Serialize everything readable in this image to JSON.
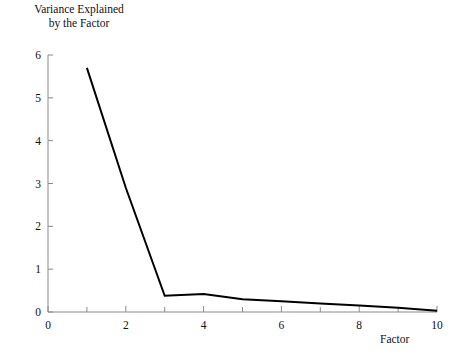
{
  "chart_data": {
    "type": "line",
    "title": "",
    "ylabel": "Variance Explained\nby the Factor",
    "xlabel": "Factor",
    "x": [
      1,
      2,
      3,
      4,
      5,
      6,
      7,
      8,
      9,
      10
    ],
    "values": [
      5.7,
      2.9,
      0.38,
      0.42,
      0.3,
      0.25,
      0.2,
      0.15,
      0.1,
      0.03
    ],
    "series": [
      {
        "name": "Variance Explained by the Factor",
        "values": [
          5.7,
          2.9,
          0.38,
          0.42,
          0.3,
          0.25,
          0.2,
          0.15,
          0.1,
          0.03
        ]
      }
    ],
    "xlim": [
      0,
      10
    ],
    "ylim": [
      0,
      6
    ],
    "x_ticks": [
      0,
      1,
      2,
      3,
      4,
      5,
      6,
      7,
      8,
      9,
      10
    ],
    "x_tick_labels": [
      "0",
      "",
      "2",
      "",
      "4",
      "",
      "6",
      "",
      "8",
      "",
      "10"
    ],
    "y_ticks": [
      0,
      1,
      2,
      3,
      4,
      5,
      6
    ],
    "y_tick_labels": [
      "0",
      "1",
      "2",
      "3",
      "4",
      "5",
      "6"
    ],
    "grid": false,
    "legend": "none",
    "line_color": "#000000",
    "axis_color": "#888888"
  },
  "axis": {
    "y_label_text": "Variance Explained\nby the Factor",
    "x_label_text": "Factor"
  }
}
